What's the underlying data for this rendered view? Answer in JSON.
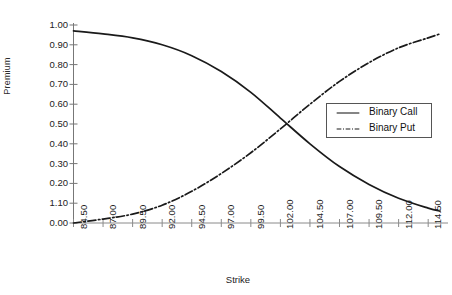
{
  "chart_data": {
    "type": "line",
    "title": "",
    "xlabel": "Strike",
    "ylabel": "Premium",
    "grid": false,
    "legend_position": "right-middle",
    "xlim": [
      84.5,
      115.5
    ],
    "ylim": [
      0.0,
      1.0
    ],
    "xtick_labels": [
      "84.50",
      "87.00",
      "89.50",
      "92.00",
      "94.50",
      "97.00",
      "99.50",
      "102.00",
      "104.50",
      "107.00",
      "109.50",
      "112.00",
      "114.50"
    ],
    "xtick_values": [
      84.5,
      87.0,
      89.5,
      92.0,
      94.5,
      97.0,
      99.5,
      102.0,
      104.5,
      107.0,
      109.5,
      112.0,
      114.5
    ],
    "ytick_labels": [
      "1.00",
      "0.90",
      "0.80",
      "0.70",
      "0.60",
      "0.50",
      "0.40",
      "0.30",
      "0.20",
      "1.10",
      "0.00"
    ],
    "ytick_values": [
      1.0,
      0.9,
      0.8,
      0.7,
      0.6,
      0.5,
      0.4,
      0.3,
      0.2,
      0.1,
      0.0
    ],
    "x": [
      84.5,
      87.0,
      89.5,
      92.0,
      94.5,
      97.0,
      99.5,
      102.0,
      104.5,
      107.0,
      109.5,
      112.0,
      114.5,
      115.5
    ],
    "series": [
      {
        "name": "Binary Call",
        "style": "solid",
        "color": "#1a1a1a",
        "values": [
          0.97,
          0.955,
          0.935,
          0.9,
          0.845,
          0.765,
          0.66,
          0.53,
          0.4,
          0.285,
          0.195,
          0.125,
          0.075,
          0.06
        ]
      },
      {
        "name": "Binary Put",
        "style": "dash-dot",
        "color": "#1a1a1a",
        "values": [
          0.0,
          0.02,
          0.045,
          0.09,
          0.16,
          0.25,
          0.355,
          0.475,
          0.6,
          0.715,
          0.81,
          0.885,
          0.935,
          0.955
        ]
      }
    ]
  },
  "legend": {
    "items": [
      {
        "label": "Binary Call",
        "style": "solid"
      },
      {
        "label": "Binary Put",
        "style": "dash-dot"
      }
    ]
  },
  "axes": {
    "x_title": "Strike",
    "y_title": "Premium"
  }
}
